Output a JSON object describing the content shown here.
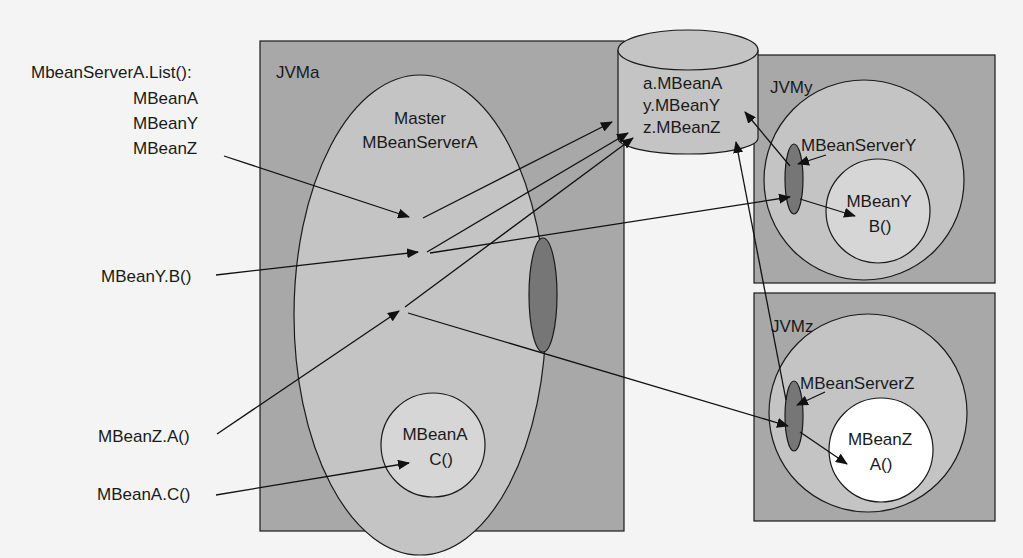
{
  "diagram": {
    "colors": {
      "background": "#f4f4f4",
      "jvm_box": "#a8a8a8",
      "server_ellipse": "#c4c4c4",
      "mbean_circle": "#d6d6d6",
      "mbean_z_circle": "#ffffff",
      "connector_dark": "#767676",
      "stroke": "#1a1a1a"
    },
    "left_labels": {
      "list_call": "MbeanServerA.List():",
      "list_items": [
        "MBeanA",
        "MBeanY",
        "MBeanZ"
      ],
      "mbeany_b": "MBeanY.B()",
      "mbeanz_a": "MBeanZ.A()",
      "mbeana_c": "MBeanA.C()"
    },
    "jvm_a": {
      "title": "JVMa",
      "master_server": {
        "line1": "Master",
        "line2": "MBeanServerA"
      },
      "mbean": {
        "line1": "MBeanA",
        "line2": "C()"
      }
    },
    "registry": {
      "entries": [
        "a.MBeanA",
        "y.MBeanY",
        "z.MBeanZ"
      ]
    },
    "jvm_y": {
      "title": "JVMy",
      "server": "MBeanServerY",
      "mbean": {
        "line1": "MBeanY",
        "line2": "B()"
      }
    },
    "jvm_z": {
      "title": "JVMz",
      "server": "MBeanServerZ",
      "mbean": {
        "line1": "MBeanZ",
        "line2": "A()"
      }
    }
  }
}
